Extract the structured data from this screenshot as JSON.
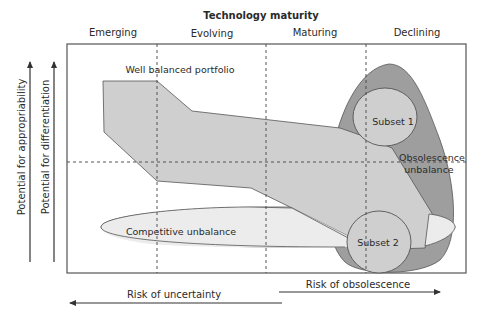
{
  "diagram": {
    "title": "Technology maturity",
    "stages": [
      "Emerging",
      "Evolving",
      "Maturing",
      "Declining"
    ],
    "y_axes": [
      {
        "label": "Potential for appropriability",
        "direction": "up"
      },
      {
        "label": "Potential for differentiation",
        "direction": "up"
      }
    ],
    "x_axes": [
      {
        "label": "Risk of uncertainty",
        "direction": "left"
      },
      {
        "label": "Risk of obsolescence",
        "direction": "right"
      }
    ],
    "regions": {
      "portfolio": "Well balanced portfolio",
      "competitive": "Competitive unbalance",
      "obsolescence_line1": "Obsolescence",
      "obsolescence_line2": "unbalance",
      "subset1": "Subset 1",
      "subset2": "Subset 2"
    },
    "colors": {
      "frame": "#555555",
      "portfolio_fill": "#cfcfcf",
      "obsolescence_fill": "#9e9e9e",
      "subset_fill": "#cfcfcf",
      "competitive_fill": "#ececec",
      "outline": "#444444",
      "arrow": "#333333"
    }
  }
}
